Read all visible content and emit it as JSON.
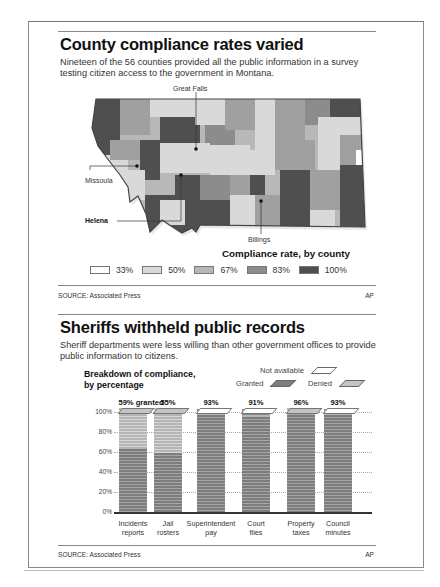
{
  "section1": {
    "title": "County compliance rates varied",
    "subtitle": "Nineteen of the 56 counties provided all the public information in a survey testing citizen access to the government in Montana.",
    "map_labels": {
      "great_falls": "Great Falls",
      "missoula": "Missoula",
      "helena": "Helena",
      "billings": "Billings"
    },
    "legend_title": "Compliance rate, by county",
    "legend": [
      {
        "label": "33%",
        "color": "#ffffff"
      },
      {
        "label": "50%",
        "color": "#d9d9d9"
      },
      {
        "label": "67%",
        "color": "#b8b8b8"
      },
      {
        "label": "83%",
        "color": "#8c8c8c"
      },
      {
        "label": "100%",
        "color": "#4f4f4f"
      }
    ],
    "source": "SOURCE: Associated Press",
    "credit": "AP"
  },
  "section2": {
    "title": "Sheriffs withheld public records",
    "subtitle": "Sheriff departments were less willing than other government offices to provide public information to citizens.",
    "chart_heading_line1": "Breakdown of compliance,",
    "chart_heading_line2": "by percentage",
    "legend": {
      "not_available": "Not available",
      "granted": "Granted",
      "denied": "Denied"
    },
    "source": "SOURCE: Associated Press",
    "credit": "AP"
  },
  "caption_cutoff": "Fallon Lincoln County in 2023 ... public records ... found",
  "chart_data": {
    "type": "bar",
    "stacked": true,
    "title": "Sheriffs withheld public records",
    "subtitle": "Breakdown of compliance, by percentage",
    "categories": [
      "Incidents reports",
      "Jail rosters",
      "Superintendent pay",
      "Court files",
      "Property taxes",
      "Council minutes"
    ],
    "top_labels": [
      "59% granted",
      "55%",
      "93%",
      "91%",
      "96%",
      "93%"
    ],
    "series": [
      {
        "name": "Granted",
        "values": [
          59,
          55,
          93,
          91,
          96,
          93
        ],
        "color": "#7d7d7d"
      },
      {
        "name": "Denied",
        "values": [
          41,
          45,
          2,
          2,
          4,
          2
        ],
        "color": "#c4c4c4"
      },
      {
        "name": "Not available",
        "values": [
          0,
          0,
          5,
          7,
          0,
          5
        ],
        "color": "#ffffff"
      }
    ],
    "yticks": [
      "100%",
      "80%",
      "60%",
      "40%",
      "20%",
      "0%"
    ],
    "ylim": [
      0,
      100
    ],
    "grid": true,
    "legend_position": "top-right"
  }
}
